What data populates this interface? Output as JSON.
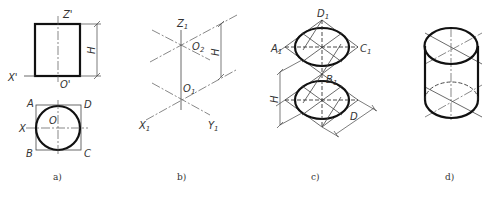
{
  "figure": {
    "panels": [
      {
        "id": "a",
        "caption": "a)",
        "description": "Orthographic views of a cylinder: front view rectangle and top view circle inscribed in square",
        "front_view": {
          "labels": {
            "z_axis": "Z'",
            "x_axis": "X'",
            "origin": "O'",
            "height": "H"
          }
        },
        "top_view": {
          "labels": {
            "a": "A",
            "d": "D",
            "x_axis": "X",
            "origin": "O",
            "b": "B",
            "c": "C"
          }
        }
      },
      {
        "id": "b",
        "caption": "b)",
        "description": "Isometric axes with two origins separated by height H",
        "labels": {
          "z_axis": "Z",
          "z_sub": "1",
          "o2": "O",
          "o2_sub": "2",
          "o1": "O",
          "o1_sub": "1",
          "x_axis": "X",
          "x_sub": "1",
          "y_axis": "Y",
          "y_sub": "1",
          "height": "H"
        }
      },
      {
        "id": "c",
        "caption": "c)",
        "description": "Isometric rhombi with inscribed ellipses for top and bottom faces",
        "labels": {
          "d1": "D",
          "d1_sub": "1",
          "a1": "A",
          "a1_sub": "1",
          "c1": "C",
          "c1_sub": "1",
          "b1": "B",
          "b1_sub": "1",
          "height": "H",
          "diameter": "D"
        }
      },
      {
        "id": "d",
        "caption": "d)",
        "description": "Finished isometric cylinder with hidden bottom ellipse arc"
      }
    ]
  }
}
